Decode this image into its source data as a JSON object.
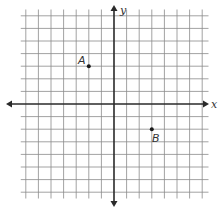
{
  "diagram": {
    "type": "coordinate-plane",
    "axes": {
      "x_label": "x",
      "y_label": "y"
    },
    "grid": {
      "x_min": -7,
      "x_max": 7,
      "y_min": -7,
      "y_max": 7,
      "spacing_px": 12.6
    },
    "points": [
      {
        "label": "A",
        "x": -2,
        "y": 3
      },
      {
        "label": "B",
        "x": 3,
        "y": -2
      }
    ],
    "colors": {
      "grid": "#8a8a8a",
      "axis": "#2a2a2a",
      "point": "#1a1a1a",
      "text": "#333333"
    }
  }
}
